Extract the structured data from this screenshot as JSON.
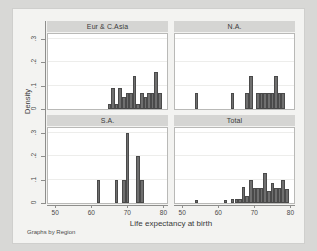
{
  "note": "Graphs by Region",
  "axes": {
    "ylabel": "Density",
    "xlabel": "Life expectancy at birth",
    "yticks": [
      "0",
      ".1",
      ".2",
      ".3"
    ],
    "xticks": [
      "50",
      "60",
      "70",
      "80"
    ]
  },
  "colors": {
    "bar_fill": "#6f6f6f",
    "bar_border": "#4a4a4a",
    "panel_title_bg": "#d5d5d3",
    "canvas_bg": "#f3f3f1",
    "plot_bg": "#ffffff",
    "page_bg": "#d8d8d6",
    "axis": "#8e8e8c",
    "gridline": "#ededeb"
  },
  "chart_data": {
    "type": "bar",
    "title": "",
    "xlabel": "Life expectancy at birth",
    "ylabel": "Density",
    "xlim": [
      48,
      81
    ],
    "ylim": [
      0,
      0.32
    ],
    "xticks": [
      50,
      60,
      70,
      80
    ],
    "yticks": [
      0,
      0.1,
      0.2,
      0.3
    ],
    "grid": true,
    "legend": "none",
    "note": "Graphs by Region",
    "binwidth": 1,
    "panels": [
      {
        "label": "Eur & C.Asia",
        "x": [
          65,
          66,
          67,
          68,
          69,
          70,
          71,
          72,
          73,
          74,
          75,
          76,
          77,
          78,
          79
        ],
        "values": [
          0.02,
          0.09,
          0.02,
          0.09,
          0.05,
          0.07,
          0.07,
          0.14,
          0.02,
          0.07,
          0.05,
          0.07,
          0.07,
          0.16,
          0.07
        ]
      },
      {
        "label": "N.A.",
        "x": [
          54,
          64,
          68,
          69,
          70,
          71,
          72,
          73,
          74,
          75,
          76,
          77,
          78
        ],
        "values": [
          0.07,
          0.07,
          0.07,
          0.14,
          0.0,
          0.07,
          0.07,
          0.07,
          0.07,
          0.07,
          0.14,
          0.07,
          0.07
        ]
      },
      {
        "label": "S.A.",
        "x": [
          62,
          67,
          69,
          70,
          73,
          74
        ],
        "values": [
          0.1,
          0.1,
          0.1,
          0.3,
          0.2,
          0.1
        ]
      },
      {
        "label": "Total",
        "x": [
          54,
          62,
          64,
          65,
          66,
          67,
          68,
          69,
          70,
          71,
          72,
          73,
          74,
          75,
          76,
          77,
          78,
          79
        ],
        "values": [
          0.012,
          0.012,
          0.018,
          0.018,
          0.018,
          0.07,
          0.03,
          0.1,
          0.065,
          0.065,
          0.065,
          0.13,
          0.05,
          0.085,
          0.065,
          0.065,
          0.1,
          0.06
        ]
      }
    ]
  }
}
